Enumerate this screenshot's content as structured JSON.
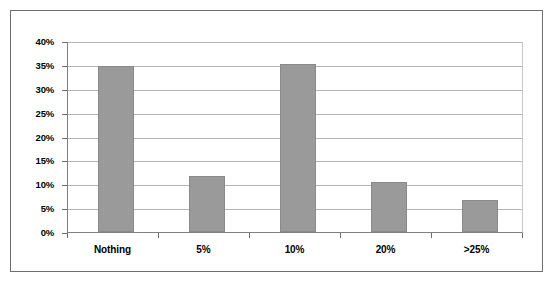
{
  "chart_data": {
    "type": "bar",
    "title": "",
    "subtitle": "",
    "xlabel": "",
    "ylabel": "",
    "categories": [
      "Nothing",
      "5%",
      "10%",
      "20%",
      ">25%"
    ],
    "values": [
      35.0,
      11.7,
      35.3,
      10.5,
      6.8
    ],
    "series": [
      {
        "name": "",
        "values": [
          35.0,
          11.7,
          35.3,
          10.5,
          6.8
        ]
      }
    ],
    "ylim": [
      0,
      40
    ],
    "ytick_values": [
      0,
      5,
      10,
      15,
      20,
      25,
      30,
      35,
      40
    ],
    "ytick_labels": [
      "0%",
      "5%",
      "10%",
      "15%",
      "20%",
      "25%",
      "30%",
      "35%",
      "40%"
    ],
    "grid": "horizontal",
    "legend": "none",
    "bar_color": "#9a9a9a",
    "bar_border_color": "#8a8a8a",
    "gridline_color": "#b4b4b4",
    "axis_color": "#808080",
    "frame_color": "#6e6e6e",
    "background_color": "#ffffff",
    "annotations": []
  }
}
